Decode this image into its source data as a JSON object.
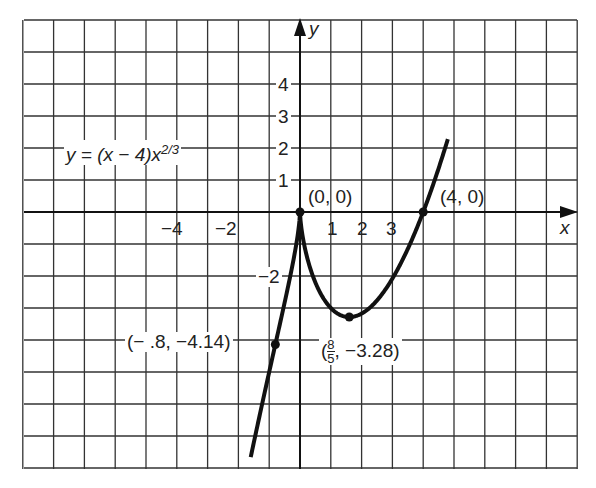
{
  "chart_data": {
    "type": "line",
    "title": "",
    "equation": {
      "prefix": "y = (x − 4)x",
      "exponent": "2/3"
    },
    "xlabel": "x",
    "ylabel": "y",
    "xlim": [
      -9,
      9
    ],
    "ylim": [
      -8,
      6
    ],
    "grid": true,
    "x_tick_labels": [
      "−4",
      "−2",
      "1",
      "2",
      "3"
    ],
    "y_tick_labels": [
      "4",
      "3",
      "2",
      "1",
      "−2"
    ],
    "series": [
      {
        "name": "y = (x − 4)x^(2/3)",
        "x_range": [
          -1.6,
          4.8
        ],
        "points": [
          [
            -1.6,
            -7.66
          ],
          [
            -1.2,
            -5.89
          ],
          [
            -0.8,
            -4.14
          ],
          [
            -0.4,
            -2.39
          ],
          [
            -0.1,
            -0.88
          ],
          [
            0,
            0
          ],
          [
            0.2,
            -1.3
          ],
          [
            0.5,
            -2.2
          ],
          [
            1.0,
            -3.0
          ],
          [
            1.6,
            -3.28
          ],
          [
            2.0,
            -3.17
          ],
          [
            2.5,
            -2.76
          ],
          [
            3.0,
            -2.08
          ],
          [
            3.5,
            -1.15
          ],
          [
            4.0,
            0
          ],
          [
            4.5,
            1.36
          ],
          [
            4.8,
            2.28
          ]
        ]
      }
    ],
    "annotations": [
      {
        "label": "(0, 0)",
        "x": 0,
        "y": 0
      },
      {
        "label": "(4, 0)",
        "x": 4,
        "y": 0
      },
      {
        "label_prefix": "(",
        "frac_num": "8",
        "frac_den": "5",
        "label_suffix": ", −3.28)",
        "x": 1.6,
        "y": -3.28
      },
      {
        "label": "(− .8, −4.14)",
        "x": -0.8,
        "y": -4.14
      }
    ]
  }
}
